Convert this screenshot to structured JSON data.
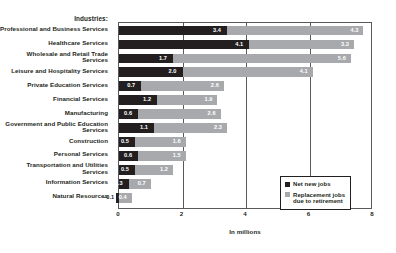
{
  "chart_data": {
    "type": "bar",
    "orientation": "horizontal",
    "stacked": true,
    "title": "",
    "xlabel": "In millions",
    "ylabel": "Industries:",
    "xlim": [
      0,
      8
    ],
    "xticks": [
      "0",
      "2",
      "4",
      "6",
      "8"
    ],
    "grid": true,
    "legend_position": "bottom-right",
    "categories": [
      "Professional and Business Services",
      "Healthcare Services",
      "Wholesale and Retail Trade Services",
      "Leisure and Hospitality Services",
      "Private Education Services",
      "Financial Services",
      "Manufacturing",
      "Government and Public Education Services",
      "Construction",
      "Personal Services",
      "Transportation and Utilities Services",
      "Information Services",
      "Natural Resources"
    ],
    "series": [
      {
        "name": "Net new jobs",
        "color": "#231f20",
        "values": [
          3.4,
          4.1,
          1.7,
          2.0,
          0.7,
          1.2,
          0.6,
          1.1,
          0.5,
          0.6,
          0.5,
          0.3,
          -0.1
        ]
      },
      {
        "name": "Replacement jobs due to retirement",
        "color": "#a7a9ac",
        "values": [
          4.3,
          3.3,
          5.6,
          4.1,
          2.6,
          1.9,
          2.6,
          2.3,
          1.6,
          1.5,
          1.2,
          0.7,
          0.4
        ]
      }
    ]
  },
  "axis_title": {
    "categories": "Industries:"
  },
  "legend": {
    "items": [
      {
        "label": "Net new jobs",
        "color": "#231f20"
      },
      {
        "label": "Replacement jobs due to retirement",
        "color": "#a7a9ac"
      }
    ]
  }
}
